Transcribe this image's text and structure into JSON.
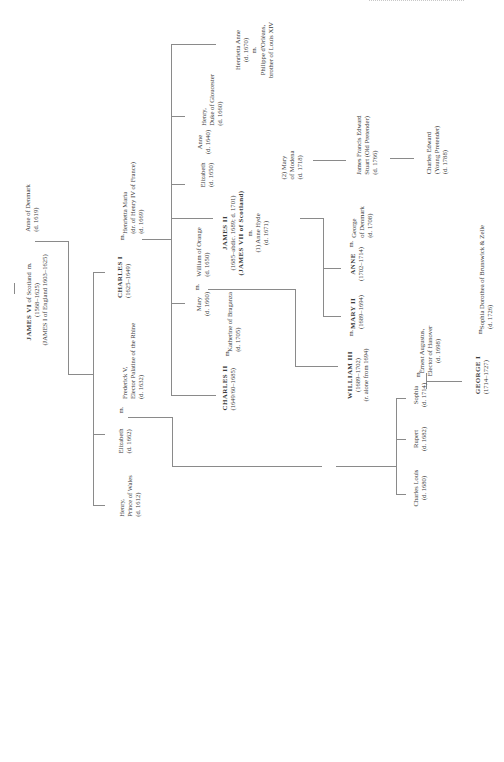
{
  "diagram": {
    "type": "family-tree",
    "orientation": "rotated-90-ccw",
    "marriage_symbol": "m.",
    "people": {
      "james_vi": {
        "name": "JAMES VI",
        "suffix": "of Scotland",
        "dates": "(1568–1625)",
        "alt": "(JAMES I of England 1603–1625)"
      },
      "anne_denmark": {
        "name": "Anne of Denmark",
        "dates": "(d. 1619)"
      },
      "henry_wales": {
        "line1": "Henry,",
        "line2": "Prince of Wales",
        "dates": "(d. 1612)"
      },
      "elizabeth_1662": {
        "name": "Elizabeth",
        "dates": "(d. 1662)"
      },
      "frederick_v": {
        "line1": "Frederick V,",
        "line2": "Elector Palatine of the Rhine",
        "dates": "(d. 1632)"
      },
      "charles_i": {
        "name": "CHARLES I",
        "dates": "(1625–1649)"
      },
      "henrietta_maria": {
        "name": "Henrietta Maria",
        "note": "(dr. of Henry IV of France)",
        "dates": "(d. 1669)"
      },
      "charles_ii": {
        "name": "CHARLES II",
        "dates": "(1649/60–1685)"
      },
      "katherine_braganza": {
        "name": "Katherine of Braganza",
        "dates": "(d. 1705)"
      },
      "mary_1660": {
        "name": "Mary",
        "dates": "(d. 1660)"
      },
      "william_orange": {
        "name": "William of Orange",
        "dates": "(d. 1650)"
      },
      "james_ii": {
        "name": "JAMES II",
        "dates": "(1685–abdic. 1689; d. 1701)",
        "alt": "(JAMES VII of Scotland)"
      },
      "anne_hyde": {
        "name": "(1) Anne Hyde",
        "dates": "(d. 1671)"
      },
      "mary_modena": {
        "line1": "(2) Mary",
        "line2": "of Modena",
        "dates": "(d. 1718)"
      },
      "elizabeth_1650": {
        "name": "Elizabeth",
        "dates": "(d. 1650)"
      },
      "anne_1640": {
        "name": "Anne",
        "dates": "(d. 1640)"
      },
      "henry_gloucester": {
        "line1": "Henry,",
        "line2": "Duke of Gloucester",
        "dates": "(d. 1660)"
      },
      "henrietta_anne": {
        "name": "Henrietta Anne",
        "dates": "(d. 1670)",
        "spouse_line1": "Philippe d'Orléans,",
        "spouse_line2": "brother of Louis XIV"
      },
      "william_iii": {
        "name": "WILLIAM III",
        "dates": "(1689–1702)",
        "note": "(r. alone from 1694)"
      },
      "mary_ii": {
        "name": "MARY II",
        "dates": "(1689–1694)"
      },
      "anne_queen": {
        "name": "ANNE",
        "dates": "(1702–1714)"
      },
      "george_denmark": {
        "line1": "George",
        "line2": "of Denmark",
        "dates": "(d. 1708)"
      },
      "james_francis": {
        "line1": "James Francis Edward",
        "line2": "Stuart (Old Pretender)",
        "dates": "(d. 1766)"
      },
      "charles_edward": {
        "line1": "Charles Edward",
        "line2": "(Young Pretender)",
        "dates": "(d. 1788)"
      },
      "charles_louis": {
        "name": "Charles Louis",
        "dates": "(d. 1680)"
      },
      "rupert": {
        "name": "Rupert",
        "dates": "(d. 1682)"
      },
      "sophia": {
        "name": "Sophia",
        "dates": "(d. 1714)"
      },
      "ernest_augustus": {
        "line1": "Ernest Augustus,",
        "line2": "Elector of Hanover",
        "dates": "(d. 1698)"
      },
      "george_i": {
        "name": "GEORGE I",
        "dates": "(1714–1727)"
      },
      "sophia_dorothea": {
        "name": "Sophia Dorothea of Brunswick & Zelle",
        "dates": "(d. 1726)"
      }
    }
  }
}
